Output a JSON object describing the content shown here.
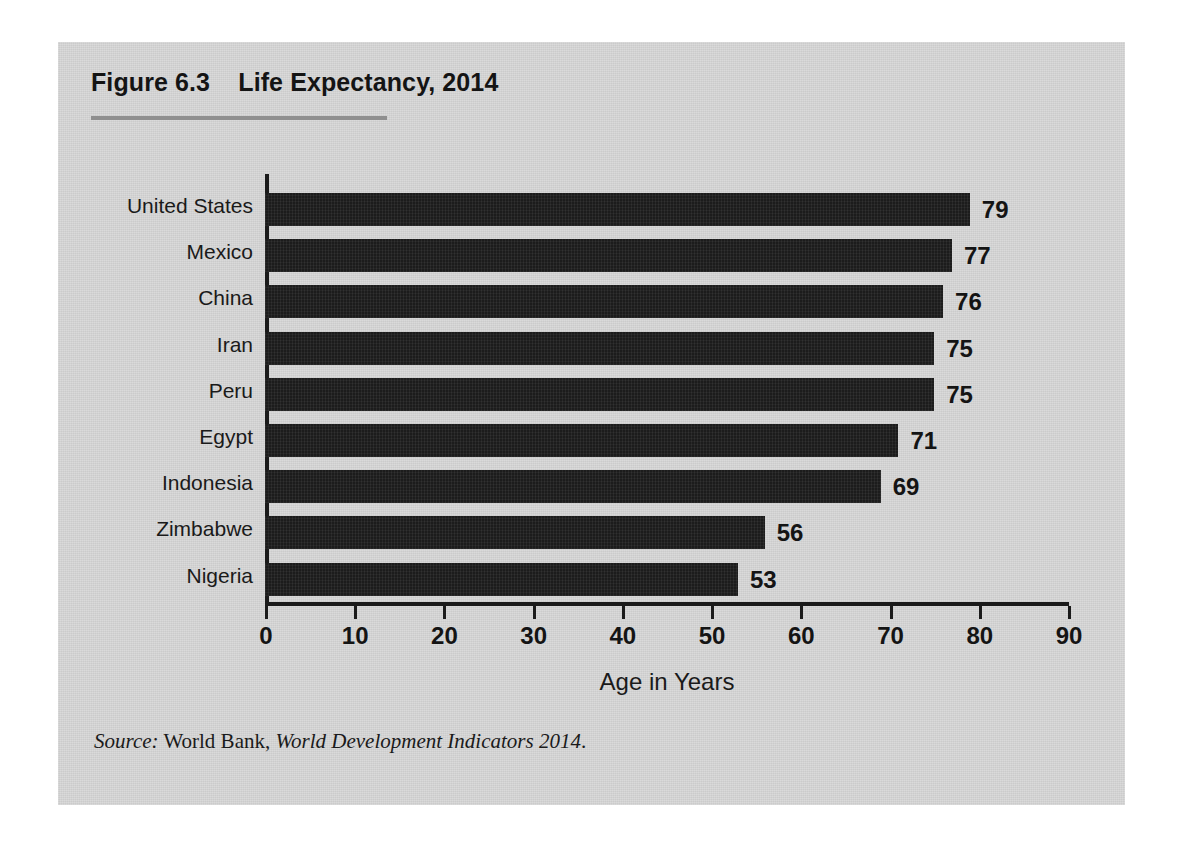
{
  "figure": {
    "title": "Figure 6.3    Life Expectancy, 2014",
    "source_prefix": "Source:",
    "source_publisher": " World Bank, ",
    "source_work": "World Development Indicators 2014",
    "source_end": ".",
    "panel_color": "#d6d6d6",
    "rule_color": "#8f8f8f",
    "bar_color": "#1c1c1c",
    "text_color": "#1a1a1a"
  },
  "chart_data": {
    "type": "bar",
    "orientation": "horizontal",
    "title": "Life Expectancy, 2014",
    "xlabel": "Age in Years",
    "ylabel": "",
    "categories": [
      "United States",
      "Mexico",
      "China",
      "Iran",
      "Peru",
      "Egypt",
      "Indonesia",
      "Zimbabwe",
      "Nigeria"
    ],
    "values": [
      79,
      77,
      76,
      75,
      75,
      71,
      69,
      56,
      53
    ],
    "value_labels": [
      "79",
      "77",
      "76",
      "75",
      "75",
      "71",
      "69",
      "56",
      "53"
    ],
    "xlim": [
      0,
      90
    ],
    "xticks": [
      0,
      10,
      20,
      30,
      40,
      50,
      60,
      70,
      80,
      90
    ],
    "xtick_labels": [
      "0",
      "10",
      "20",
      "30",
      "40",
      "50",
      "60",
      "70",
      "80",
      "90"
    ],
    "grid": false,
    "legend": false,
    "series": [
      {
        "name": "Life expectancy at birth (years)",
        "values": [
          79,
          77,
          76,
          75,
          75,
          71,
          69,
          56,
          53
        ]
      }
    ]
  }
}
